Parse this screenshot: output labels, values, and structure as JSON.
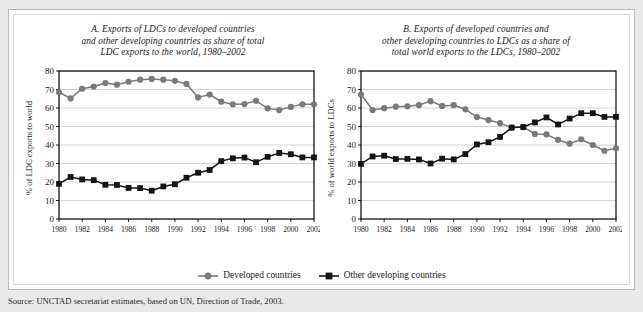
{
  "figure": {
    "source_line": "Source:  UNCTAD secretariat estimates, based on UN, Direction of Trade, 2003.",
    "legend": [
      {
        "label": "Developed countries",
        "marker": "circle-marker",
        "color": "#7a7a7a"
      },
      {
        "label": "Other developing countries",
        "marker": "square-marker",
        "color": "#141414"
      }
    ]
  },
  "chart_data": [
    {
      "type": "line",
      "panel": "A",
      "title": "A.  Exports of LDCs to developed countries and other developing countries as share of total LDC exports to the world, 1980–2002",
      "title_lines": [
        "A.  Exports of LDCs to developed countries",
        "and other developing countries as share of total",
        "LDC exports to the world, 1980–2002"
      ],
      "xlabel": "",
      "ylabel": "% of LDC exports to world",
      "ylim": [
        0,
        80
      ],
      "yticks": [
        0,
        10,
        20,
        30,
        40,
        50,
        60,
        70,
        80
      ],
      "xlim": [
        1980,
        2002
      ],
      "xticks": [
        1980,
        1982,
        1984,
        1986,
        1988,
        1990,
        1992,
        1994,
        1996,
        1998,
        2000,
        2002
      ],
      "x": [
        1980,
        1981,
        1982,
        1983,
        1984,
        1985,
        1986,
        1987,
        1988,
        1989,
        1990,
        1991,
        1992,
        1993,
        1994,
        1995,
        1996,
        1997,
        1998,
        1999,
        2000,
        2001,
        2002
      ],
      "grid": true,
      "legend_position": "bottom",
      "series": [
        {
          "name": "Developed countries",
          "color": "#7a7a7a",
          "marker": "circle",
          "values": [
            68.5,
            65.2,
            70.4,
            71.6,
            73.5,
            72.6,
            74.2,
            75.3,
            75.7,
            75.3,
            74.7,
            73.0,
            65.7,
            67.3,
            63.4,
            62.0,
            62.1,
            63.9,
            59.8,
            58.9,
            60.6,
            62.0,
            62.0
          ]
        },
        {
          "name": "Other developing countries",
          "color": "#141414",
          "marker": "square",
          "values": [
            19.0,
            22.7,
            21.4,
            21.0,
            18.5,
            18.4,
            16.8,
            16.7,
            15.3,
            17.6,
            18.8,
            22.3,
            25.0,
            26.5,
            31.3,
            32.8,
            33.2,
            30.7,
            33.6,
            35.7,
            35.0,
            33.3,
            33.3
          ]
        }
      ]
    },
    {
      "type": "line",
      "panel": "B",
      "title": "B.  Exports of developed countries and other developing countries to LDCs as a share of total world exports to the LDCs, 1980–2002",
      "title_lines": [
        "B.  Exports of developed countries and",
        "other developing countries to LDCs as a share of",
        "total world exports to the LDCs, 1980–2002"
      ],
      "xlabel": "",
      "ylabel": "% of world exports to LDCs",
      "ylim": [
        0,
        80
      ],
      "yticks": [
        0,
        10,
        20,
        30,
        40,
        50,
        60,
        70,
        80
      ],
      "xlim": [
        1980,
        2002
      ],
      "xticks": [
        1980,
        1982,
        1984,
        1986,
        1988,
        1990,
        1992,
        1994,
        1996,
        1998,
        2000,
        2002
      ],
      "x": [
        1980,
        1981,
        1982,
        1983,
        1984,
        1985,
        1986,
        1987,
        1988,
        1989,
        1990,
        1991,
        1992,
        1993,
        1994,
        1995,
        1996,
        1997,
        1998,
        1999,
        2000,
        2001,
        2002
      ],
      "grid": true,
      "legend_position": "bottom",
      "series": [
        {
          "name": "Developed countries",
          "color": "#7a7a7a",
          "marker": "circle",
          "values": [
            67.3,
            58.9,
            59.9,
            60.7,
            60.9,
            61.6,
            63.7,
            61.1,
            61.5,
            59.3,
            55.1,
            53.5,
            51.8,
            49.4,
            49.7,
            46.0,
            45.7,
            42.8,
            40.7,
            43.1,
            40.0,
            36.9,
            38.2,
            38.8
          ]
        },
        {
          "name": "Other developing countries",
          "color": "#141414",
          "marker": "square",
          "values": [
            29.8,
            33.8,
            34.2,
            32.4,
            32.5,
            32.2,
            30.0,
            32.6,
            32.2,
            35.1,
            40.3,
            41.5,
            44.4,
            49.4,
            49.7,
            52.2,
            54.9,
            51.1,
            54.3,
            57.2,
            57.2,
            55.2,
            55.2
          ]
        }
      ]
    }
  ]
}
